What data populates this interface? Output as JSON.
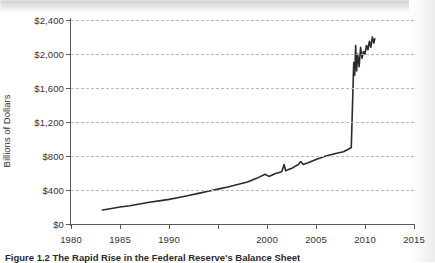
{
  "figure": {
    "caption_number": "Figure 1.2",
    "caption_text": "The Rapid Rise in the Federal Reserve's Balance Sheet"
  },
  "axes": {
    "y_title": "Billions of Dollars",
    "y_ticks": [
      "$0",
      "$400",
      "$800",
      "$1,200",
      "$1,600",
      "$2,000",
      "$2,400"
    ],
    "x_ticks": [
      "1980",
      "1985",
      "1990",
      "",
      "2000",
      "2005",
      "2010",
      "2015"
    ]
  },
  "colors": {
    "line": "#2b2b2b",
    "axis": "#5a5a5a",
    "grid": "#b9b9b9",
    "background": "#ffffff"
  },
  "chart_data": {
    "type": "line",
    "title": "The Rapid Rise in the Federal Reserve's Balance Sheet",
    "xlabel": "",
    "ylabel": "Billions of Dollars",
    "xlim": [
      1980,
      2015
    ],
    "ylim": [
      0,
      2400
    ],
    "grid": true,
    "legend": null,
    "y_tick_values": [
      0,
      400,
      800,
      1200,
      1600,
      2000,
      2400
    ],
    "x_tick_values": [
      1980,
      1985,
      1990,
      1995,
      2000,
      2005,
      2010,
      2015
    ],
    "x_tick_labels": [
      "1980",
      "1985",
      "1990",
      "",
      "2000",
      "2005",
      "2010",
      "2015"
    ],
    "series": [
      {
        "name": "Federal Reserve Balance Sheet",
        "x": [
          1983.2,
          1984.0,
          1985.0,
          1986.0,
          1987.0,
          1988.0,
          1989.0,
          1990.0,
          1991.0,
          1992.0,
          1993.0,
          1994.0,
          1995.0,
          1996.0,
          1997.0,
          1998.0,
          1999.0,
          1999.8,
          2000.2,
          2000.8,
          2001.5,
          2001.75,
          2001.9,
          2002.2,
          2002.6,
          2003.2,
          2003.45,
          2003.7,
          2004.2,
          2005.0,
          2006.0,
          2007.0,
          2007.8,
          2008.3,
          2008.6,
          2008.75,
          2008.85,
          2008.95,
          2009.05,
          2009.15,
          2009.25,
          2009.4,
          2009.55,
          2009.7,
          2009.85,
          2010.0,
          2010.15,
          2010.3,
          2010.45,
          2010.6,
          2010.75,
          2010.9,
          2011.0
        ],
        "y": [
          165,
          180,
          200,
          215,
          235,
          255,
          272,
          290,
          312,
          335,
          360,
          385,
          410,
          435,
          465,
          495,
          540,
          585,
          560,
          590,
          615,
          700,
          625,
          640,
          660,
          700,
          735,
          700,
          720,
          760,
          800,
          830,
          850,
          880,
          900,
          1500,
          1900,
          1750,
          2100,
          1800,
          2000,
          1850,
          2080,
          1950,
          2030,
          2000,
          2100,
          2050,
          2150,
          2080,
          2200,
          2130,
          2180
        ]
      }
    ],
    "annotations": [
      {
        "text": "small spike near 2001-2002 (9/11 liquidity)",
        "x": 2001.75,
        "y": 700
      },
      {
        "text": "small spike near 2003 (year-end)",
        "x": 2003.45,
        "y": 735
      },
      {
        "text": "near-vertical jump in late 2008 (financial crisis)",
        "x": 2008.8,
        "y": 1900
      }
    ]
  }
}
